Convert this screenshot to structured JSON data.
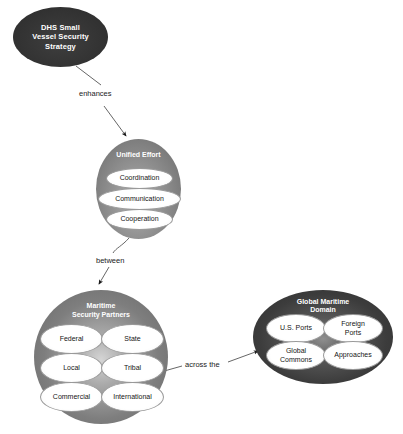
{
  "diagram": {
    "background": "#ffffff",
    "nodes": [
      {
        "id": "dhs",
        "label": "DHS Small Vessel Security Strategy",
        "lines": [
          "DHS Small",
          "Vessel Security",
          "Strategy"
        ],
        "fill": "#343434",
        "text_color": "#ffffff",
        "children": []
      },
      {
        "id": "unified_effort",
        "label": "Unified Effort",
        "fill": "#8a8a8a",
        "text_color": "#ffffff",
        "children": [
          {
            "label": "Coordination"
          },
          {
            "label": "Communication"
          },
          {
            "label": "Cooperation"
          }
        ]
      },
      {
        "id": "maritime_security_partners",
        "label": "Maritime Security Partners",
        "lines": [
          "Maritime",
          "Security Partners"
        ],
        "fill": "#8d8d8d",
        "text_color": "#ffffff",
        "children": [
          {
            "label": "Federal"
          },
          {
            "label": "State"
          },
          {
            "label": "Local"
          },
          {
            "label": "Tribal"
          },
          {
            "label": "Commercial"
          },
          {
            "label": "International"
          }
        ]
      },
      {
        "id": "global_maritime_domain",
        "label": "Global Maritime Domain",
        "lines": [
          "Global Maritime",
          "Domain"
        ],
        "fill": "#3c3c3c",
        "text_color": "#ffffff",
        "children": [
          {
            "label": "U.S. Ports",
            "lines": [
              "U.S. Ports"
            ]
          },
          {
            "label": "Foreign Ports",
            "lines": [
              "Foreign",
              "Ports"
            ]
          },
          {
            "label": "Global Commons",
            "lines": [
              "Global",
              "Commons"
            ]
          },
          {
            "label": "Approaches",
            "lines": [
              "Approaches"
            ]
          }
        ]
      }
    ],
    "edges": [
      {
        "id": "edge-enhances",
        "label": "enhances",
        "from": "dhs",
        "to": "unified_effort"
      },
      {
        "id": "edge-between",
        "label": "between",
        "from": "unified_effort",
        "to": "maritime_security_partners"
      },
      {
        "id": "edge-across-the",
        "label": "across the",
        "from": "maritime_security_partners",
        "to": "global_maritime_domain"
      }
    ]
  }
}
